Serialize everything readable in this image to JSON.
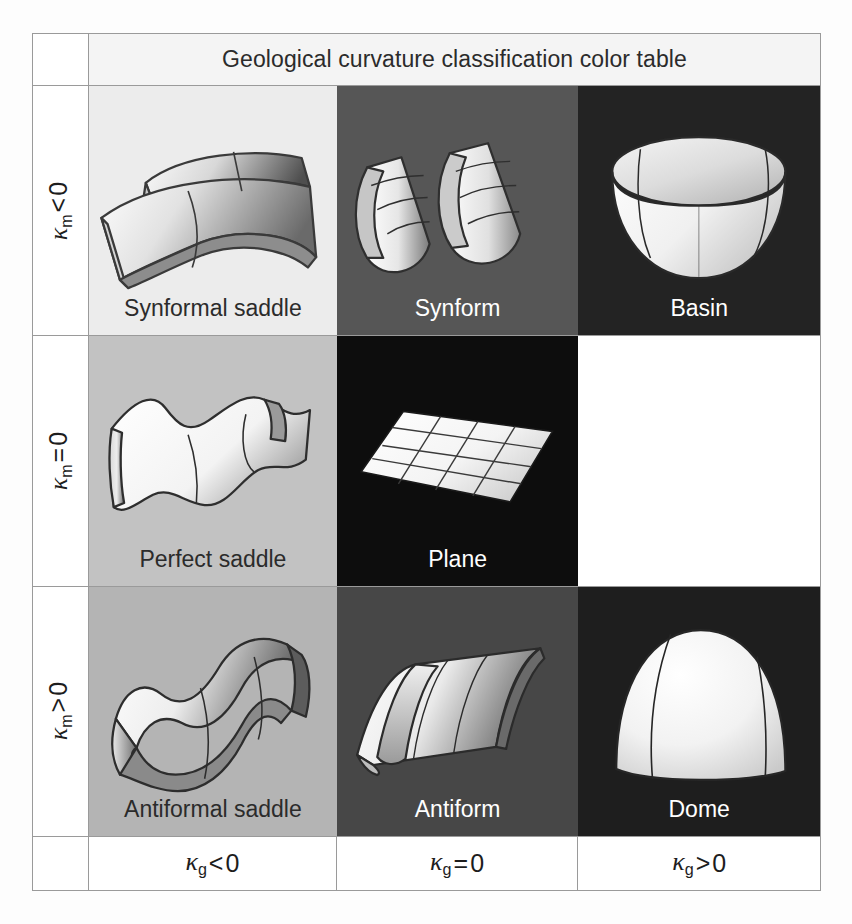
{
  "header": {
    "title": "Geological curvature classification color table"
  },
  "row_labels": [
    {
      "symbol": "κ",
      "subscript": "m",
      "operator": "<",
      "value": "0",
      "text": "κm < 0"
    },
    {
      "symbol": "κ",
      "subscript": "m",
      "operator": "=",
      "value": "0",
      "text": "κm = 0"
    },
    {
      "symbol": "κ",
      "subscript": "m",
      "operator": ">",
      "value": "0",
      "text": "κm > 0"
    }
  ],
  "column_labels": [
    {
      "symbol": "κ",
      "subscript": "g",
      "operator": "<",
      "value": "0",
      "text": "κg < 0"
    },
    {
      "symbol": "κ",
      "subscript": "g",
      "operator": "=",
      "value": "0",
      "text": "κg = 0"
    },
    {
      "symbol": "κ",
      "subscript": "g",
      "operator": ">",
      "value": "0",
      "text": "κg > 0"
    }
  ],
  "cells": [
    [
      {
        "label": "Synformal saddle",
        "bg": "#ececec",
        "text_color": "#2b2b2b",
        "shape": "synformal-saddle",
        "empty": false
      },
      {
        "label": "Synform",
        "bg": "#565656",
        "text_color": "#ffffff",
        "shape": "synform",
        "empty": false
      },
      {
        "label": "Basin",
        "bg": "#232323",
        "text_color": "#ffffff",
        "shape": "basin",
        "empty": false
      }
    ],
    [
      {
        "label": "Perfect saddle",
        "bg": "#c2c2c2",
        "text_color": "#2b2b2b",
        "shape": "perfect-saddle",
        "empty": false
      },
      {
        "label": "Plane",
        "bg": "#0d0d0d",
        "text_color": "#ffffff",
        "shape": "plane",
        "empty": false
      },
      {
        "label": "",
        "bg": "#ffffff",
        "text_color": "#ffffff",
        "shape": "none",
        "empty": true
      }
    ],
    [
      {
        "label": "Antiformal saddle",
        "bg": "#b4b4b4",
        "text_color": "#2b2b2b",
        "shape": "antiformal-saddle",
        "empty": false
      },
      {
        "label": "Antiform",
        "bg": "#474747",
        "text_color": "#ffffff",
        "shape": "antiform",
        "empty": false
      },
      {
        "label": "Dome",
        "bg": "#1e1e1e",
        "text_color": "#ffffff",
        "shape": "dome",
        "empty": false
      }
    ]
  ],
  "style": {
    "border_color": "#9a9a9a",
    "title_bg": "#f4f4f4",
    "page_bg": "#fdfdfd",
    "surface_light": "#fbfbfb",
    "surface_dark": "#5e5e5e",
    "outline": "#3a3a3a"
  }
}
